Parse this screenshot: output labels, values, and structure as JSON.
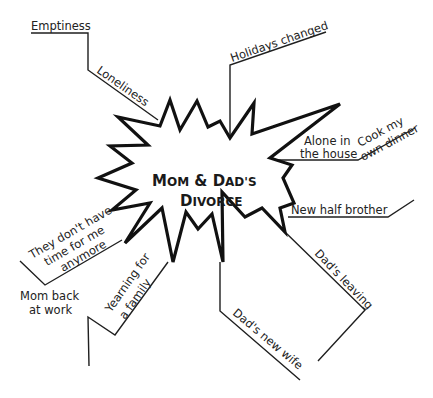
{
  "diagram": {
    "type": "web-map",
    "center": {
      "line1_big1": "M",
      "line1_small1": "OM",
      "line1_mid": " & ",
      "line1_big2": "D",
      "line1_small2": "AD'S",
      "line2_big": "D",
      "line2_small": "IVORCE",
      "full_text": "Mom & Dad's Divorce"
    },
    "branches": [
      {
        "label": "Emptiness"
      },
      {
        "label": "Loneliness"
      },
      {
        "label": "Holidays changed"
      },
      {
        "label": "Alone in",
        "label2": "the house"
      },
      {
        "label": "Cook my",
        "label2": "own dinner"
      },
      {
        "label": "New half brother"
      },
      {
        "label": "Dad's leaving"
      },
      {
        "label": "Dad's new wife"
      },
      {
        "label": "Yearning for",
        "label2": "a family"
      },
      {
        "label": "Mom back",
        "label2": "at work"
      },
      {
        "label": "They don't have",
        "label2": "time for me",
        "label3": "anymore"
      }
    ],
    "colors": {
      "line": "#1f1f1f",
      "text": "#222222",
      "background": "#ffffff"
    }
  }
}
